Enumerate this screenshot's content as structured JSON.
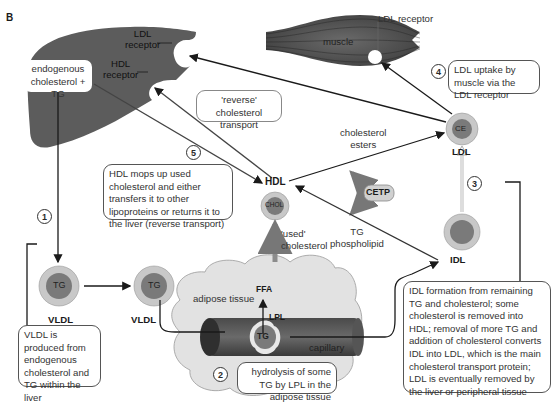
{
  "figure_label": "B",
  "organs": {
    "liver": {
      "ldl_receptor": "LDL",
      "ldl_receptor_2": "receptor",
      "hdl_receptor": "HDL",
      "hdl_receptor_2": "receptor",
      "box": "endogenous cholesterol + TG"
    },
    "muscle": {
      "label": "muscle",
      "receptor": "LDL receptor"
    },
    "adipose": {
      "label": "adipose tissue",
      "capillary": "capillary",
      "ffa": "FFA",
      "lpl": "LPL",
      "tg": "TG"
    }
  },
  "particles": {
    "vldl1": {
      "core": "TG",
      "label": "VLDL"
    },
    "vldl2": {
      "core": "TG",
      "label": "VLDL"
    },
    "hdl": {
      "core": "CHOL",
      "label": "HDL"
    },
    "ldl": {
      "core": "CE",
      "label": "LDL"
    },
    "idl": {
      "core": "",
      "label": "IDL"
    },
    "cetp": {
      "label": "CETP"
    }
  },
  "arrow_labels": {
    "reverse": "'reverse' cholesterol transport",
    "cholesterol_esters_1": "cholesterol",
    "cholesterol_esters_2": "esters",
    "tg_phospholipid_1": "TG",
    "tg_phospholipid_2": "phospholipid",
    "used_cholesterol_1": "'used'",
    "used_cholesterol_2": "cholesterol"
  },
  "steps": [
    {
      "number": "1",
      "text": "VLDL is produced from endogenous cholesterol and TG within the liver"
    },
    {
      "number": "2",
      "text": "hydrolysis of some TG by LPL in the adipose tissue"
    },
    {
      "number": "3",
      "text": "IDL formation from remaining TG and cholesterol; some cholesterol is removed into HDL; removal of more TG and addition of cholesterol converts IDL into LDL, which is the main cholesterol transport protein; LDL is eventually removed by the liver or peripheral tissue"
    },
    {
      "number": "4",
      "text": "LDL uptake by muscle via the LDL receptor"
    },
    {
      "number": "5",
      "text": "HDL mops up used cholesterol and either transfers it to other lipoproteins or returns it to the liver (reverse transport)"
    }
  ],
  "colors": {
    "organ_dark": "#5c5c5c",
    "particle_outer": "#c8c8c8",
    "particle_core": "#7a7a7a",
    "adipose": "#e2e2e2",
    "arrow": "#1a1a1a",
    "grey_arrow": "#8c8c8c"
  }
}
